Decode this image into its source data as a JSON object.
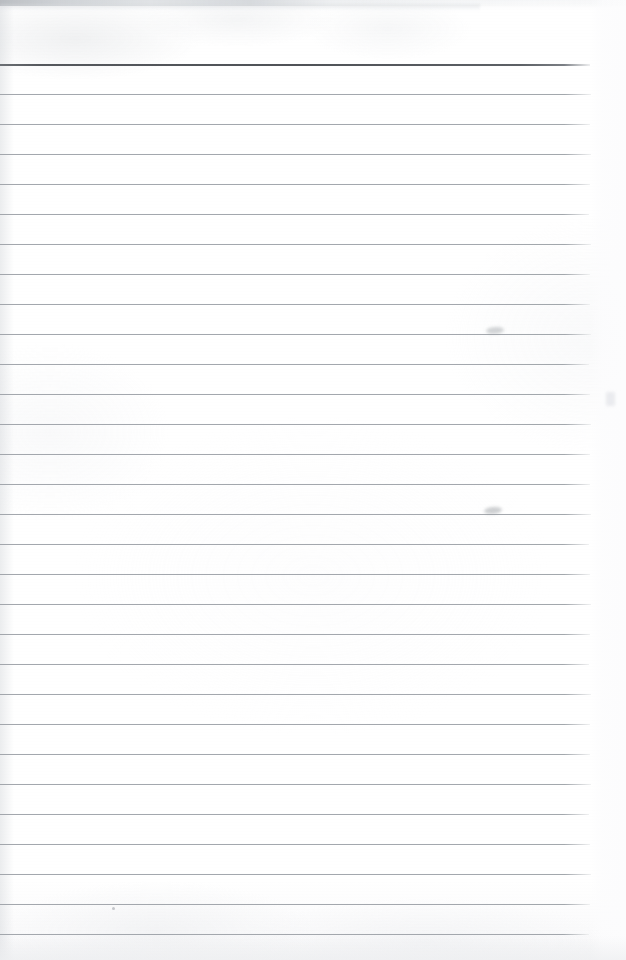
{
  "document": {
    "kind": "scanned-ruled-notepad-page",
    "title": "Blank lined paper scan",
    "page_width": 626,
    "page_height": 960,
    "background_color": "#fdfdfd",
    "has_text_content": false,
    "written_content": "",
    "transcription": ""
  },
  "ruling": {
    "line_count": 30,
    "first_line_y": 64,
    "line_spacing": 30,
    "line_start_x": 0,
    "line_end_x": 590,
    "normal_line_color": "#9ba0a6",
    "normal_line_thickness": 1,
    "header_line_color": "#55585d",
    "header_line_thickness": 2,
    "header_line_index": 0,
    "lines": [
      {
        "index": 0,
        "y": 64,
        "weight": "heavy",
        "width": 590
      },
      {
        "index": 1,
        "y": 94,
        "weight": "normal",
        "width": 591
      },
      {
        "index": 2,
        "y": 124,
        "weight": "normal",
        "width": 590
      },
      {
        "index": 3,
        "y": 154,
        "weight": "normal",
        "width": 591
      },
      {
        "index": 4,
        "y": 184,
        "weight": "normal",
        "width": 590
      },
      {
        "index": 5,
        "y": 214,
        "weight": "normal",
        "width": 589
      },
      {
        "index": 6,
        "y": 244,
        "weight": "normal",
        "width": 591
      },
      {
        "index": 7,
        "y": 274,
        "weight": "normal",
        "width": 590
      },
      {
        "index": 8,
        "y": 304,
        "weight": "normal",
        "width": 590
      },
      {
        "index": 9,
        "y": 334,
        "weight": "normal",
        "width": 591
      },
      {
        "index": 10,
        "y": 364,
        "weight": "normal",
        "width": 589
      },
      {
        "index": 11,
        "y": 394,
        "weight": "normal",
        "width": 590
      },
      {
        "index": 12,
        "y": 424,
        "weight": "normal",
        "width": 591
      },
      {
        "index": 13,
        "y": 454,
        "weight": "normal",
        "width": 590
      },
      {
        "index": 14,
        "y": 484,
        "weight": "normal",
        "width": 590
      },
      {
        "index": 15,
        "y": 514,
        "weight": "normal",
        "width": 591
      },
      {
        "index": 16,
        "y": 544,
        "weight": "normal",
        "width": 589
      },
      {
        "index": 17,
        "y": 574,
        "weight": "normal",
        "width": 590
      },
      {
        "index": 18,
        "y": 604,
        "weight": "normal",
        "width": 591
      },
      {
        "index": 19,
        "y": 634,
        "weight": "normal",
        "width": 590
      },
      {
        "index": 20,
        "y": 664,
        "weight": "normal",
        "width": 589
      },
      {
        "index": 21,
        "y": 694,
        "weight": "normal",
        "width": 591
      },
      {
        "index": 22,
        "y": 724,
        "weight": "normal",
        "width": 590
      },
      {
        "index": 23,
        "y": 754,
        "weight": "normal",
        "width": 590
      },
      {
        "index": 24,
        "y": 784,
        "weight": "normal",
        "width": 591
      },
      {
        "index": 25,
        "y": 814,
        "weight": "normal",
        "width": 589
      },
      {
        "index": 26,
        "y": 844,
        "weight": "normal",
        "width": 590
      },
      {
        "index": 27,
        "y": 874,
        "weight": "normal",
        "width": 591
      },
      {
        "index": 28,
        "y": 904,
        "weight": "normal",
        "width": 590
      },
      {
        "index": 29,
        "y": 934,
        "weight": "normal",
        "width": 589
      }
    ]
  },
  "scan_artifacts": {
    "top_band": {
      "y": 0,
      "height": 6,
      "description": "gray scanner band along the top edge, darkest at left"
    },
    "marks": [
      {
        "name": "smudge-upper",
        "x": 486,
        "y": 327,
        "kind": "smudge"
      },
      {
        "name": "smudge-lower",
        "x": 484,
        "y": 507,
        "kind": "smudge"
      },
      {
        "name": "speck-lower-left",
        "x": 112,
        "y": 907,
        "kind": "speck"
      },
      {
        "name": "light-blotch-right",
        "x": 606,
        "y": 392,
        "kind": "blotch"
      }
    ],
    "bottom_foot_height": 24,
    "right_margin_width": 36
  }
}
